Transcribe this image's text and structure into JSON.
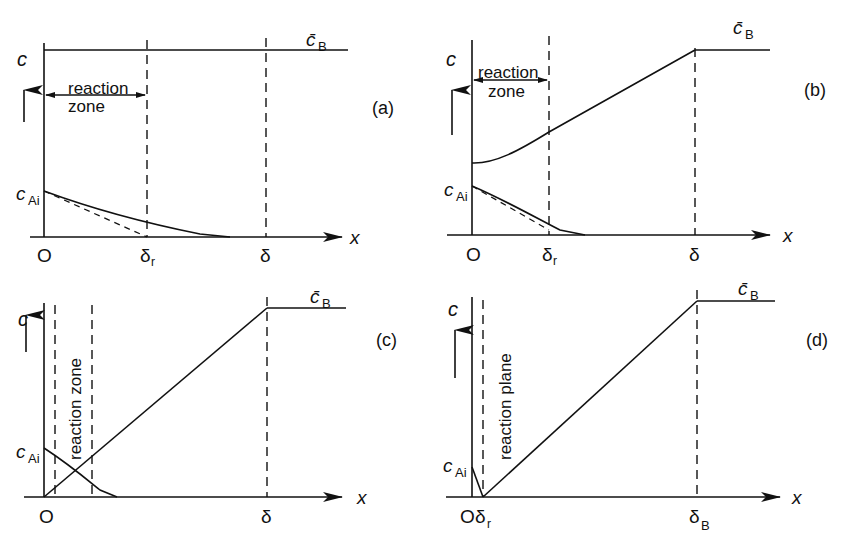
{
  "figure": {
    "panels": [
      {
        "id": "a",
        "tag": "(a)",
        "y_axis_label": "c",
        "x_axis_label": "x",
        "origin_label": "O",
        "curve_A_label_main": "c",
        "curve_A_label_sub": "Ai",
        "plateau_label_main": "c̄",
        "plateau_label_sub": "B",
        "zone_label_line1": "reaction",
        "zone_label_line2": "zone",
        "tick_1_main": "δ",
        "tick_1_sub": "r",
        "tick_2_main": "δ",
        "tick_2_sub": ""
      },
      {
        "id": "b",
        "tag": "(b)",
        "y_axis_label": "c",
        "x_axis_label": "x",
        "origin_label": "O",
        "curve_A_label_main": "c",
        "curve_A_label_sub": "Ai",
        "plateau_label_main": "c̄",
        "plateau_label_sub": "B",
        "zone_label_line1": "reaction",
        "zone_label_line2": "zone",
        "tick_1_main": "δ",
        "tick_1_sub": "r",
        "tick_2_main": "δ",
        "tick_2_sub": ""
      },
      {
        "id": "c",
        "tag": "(c)",
        "y_axis_label": "c",
        "x_axis_label": "x",
        "origin_label": "O",
        "curve_A_label_main": "c",
        "curve_A_label_sub": "Ai",
        "plateau_label_main": "c̄",
        "plateau_label_sub": "B",
        "zone_label_vertical": "reaction zone",
        "tick_2_main": "δ",
        "tick_2_sub": ""
      },
      {
        "id": "d",
        "tag": "(d)",
        "y_axis_label": "c",
        "x_axis_label": "x",
        "origin_label": "O",
        "curve_A_label_main": "c",
        "curve_A_label_sub": "Ai",
        "plateau_label_main": "c̄",
        "plateau_label_sub": "B",
        "zone_label_vertical": "reaction plane",
        "tick_1_main": "δ",
        "tick_1_sub": "r",
        "tick_2_main": "δ",
        "tick_2_sub": "B"
      }
    ],
    "colors": {
      "ink": "#111111",
      "background": "#ffffff"
    }
  }
}
